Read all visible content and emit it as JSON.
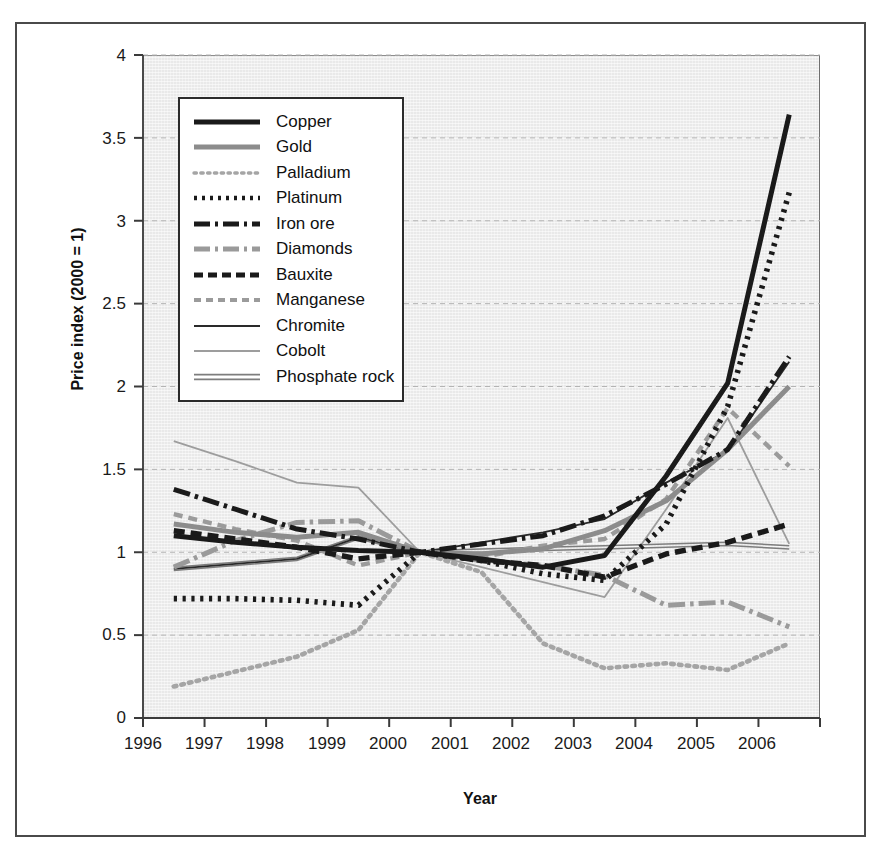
{
  "chart_data": {
    "type": "line",
    "title": "",
    "xlabel": "Year",
    "ylabel": "Price index (2000 = 1)",
    "xlim": [
      1996,
      2007
    ],
    "ylim": [
      0,
      4
    ],
    "x_tick_labels": [
      "1996",
      "1997",
      "1998",
      "1999",
      "2000",
      "2001",
      "2002",
      "2003",
      "2004",
      "2005",
      "2006"
    ],
    "y_tick_labels": [
      "0",
      "0.5",
      "1",
      "1.5",
      "2",
      "2.5",
      "3",
      "3.5",
      "4"
    ],
    "y_ticks": [
      0,
      0.5,
      1,
      1.5,
      2,
      2.5,
      3,
      3.5,
      4
    ],
    "grid": "horizontal-dashed",
    "legend_position": "upper-left-inside",
    "x": [
      1996.5,
      1997.5,
      1998.5,
      1999.5,
      2000.5,
      2001.5,
      2002.5,
      2003.5,
      2004.5,
      2005.5,
      2006.5
    ],
    "series": [
      {
        "name": "Copper",
        "style": "solid-thick-black",
        "color": "#1a1a1a",
        "values": [
          1.1,
          1.06,
          1.03,
          1.01,
          1.0,
          0.96,
          0.91,
          0.98,
          1.46,
          2.02,
          3.64
        ]
      },
      {
        "name": "Gold",
        "style": "solid-thick-gray",
        "color": "#8c8c8c",
        "values": [
          1.17,
          1.12,
          1.09,
          1.12,
          1.0,
          0.99,
          1.02,
          1.13,
          1.31,
          1.62,
          2.0
        ]
      },
      {
        "name": "Palladium",
        "style": "dotted-gray",
        "color": "#a5a5a5",
        "values": [
          0.19,
          0.28,
          0.37,
          0.53,
          1.0,
          0.88,
          0.45,
          0.3,
          0.33,
          0.29,
          0.45
        ]
      },
      {
        "name": "Platinum",
        "style": "dotted-black",
        "color": "#1a1a1a",
        "values": [
          0.72,
          0.72,
          0.71,
          0.68,
          1.0,
          0.95,
          0.87,
          0.83,
          1.17,
          1.88,
          3.17
        ]
      },
      {
        "name": "Iron ore",
        "style": "dashdot-thick-black",
        "color": "#1a1a1a",
        "values": [
          1.38,
          1.26,
          1.14,
          1.08,
          1.0,
          1.05,
          1.1,
          1.22,
          1.41,
          1.62,
          2.18
        ]
      },
      {
        "name": "Diamonds",
        "style": "dashdot-thick-gray",
        "color": "#9a9a9a",
        "values": [
          0.91,
          1.07,
          1.18,
          1.19,
          1.0,
          0.95,
          0.92,
          0.86,
          0.68,
          0.7,
          0.55
        ]
      },
      {
        "name": "Bauxite",
        "style": "dashed-thick-black",
        "color": "#1a1a1a",
        "values": [
          1.13,
          1.08,
          1.03,
          0.96,
          1.0,
          0.95,
          0.92,
          0.85,
          0.99,
          1.06,
          1.17
        ]
      },
      {
        "name": "Manganese",
        "style": "dashed-gray",
        "color": "#9b9b9b",
        "values": [
          1.23,
          1.14,
          1.07,
          0.92,
          1.0,
          0.97,
          1.04,
          1.08,
          1.32,
          1.87,
          1.52
        ]
      },
      {
        "name": "Chromite",
        "style": "solid-thin-black",
        "color": "#2a2a2a",
        "values": [
          0.9,
          0.93,
          0.96,
          1.09,
          1.0,
          1.06,
          1.12,
          1.2,
          1.42,
          1.61,
          2.15
        ]
      },
      {
        "name": "Cobolt",
        "style": "solid-thin-gray",
        "color": "#9d9d9d",
        "values": [
          1.67,
          1.55,
          1.42,
          1.39,
          1.0,
          0.91,
          0.82,
          0.73,
          1.26,
          1.81,
          1.05
        ]
      },
      {
        "name": "Phosphate rock",
        "style": "double-thin-gray",
        "color": "#7d7d7d",
        "values": [
          0.9,
          0.93,
          0.96,
          1.09,
          1.0,
          1.01,
          1.02,
          1.03,
          1.04,
          1.05,
          1.03
        ]
      }
    ]
  },
  "axes": {
    "y_label": "Price index (2000 = 1)",
    "x_label": "Year",
    "y_ticks": [
      "4",
      "3.5",
      "3",
      "2.5",
      "2",
      "1.5",
      "1",
      "0.5",
      "0"
    ],
    "x_ticks": [
      "1996",
      "1997",
      "1998",
      "1999",
      "2000",
      "2001",
      "2002",
      "2003",
      "2004",
      "2005",
      "2006"
    ]
  },
  "legend": {
    "items": [
      {
        "label": "Copper"
      },
      {
        "label": "Gold"
      },
      {
        "label": "Palladium"
      },
      {
        "label": "Platinum"
      },
      {
        "label": "Iron ore"
      },
      {
        "label": "Diamonds"
      },
      {
        "label": "Bauxite"
      },
      {
        "label": "Manganese"
      },
      {
        "label": "Chromite"
      },
      {
        "label": "Cobolt"
      },
      {
        "label": "Phosphate rock"
      }
    ]
  },
  "colors": {
    "plot_background": "#e9e9e9",
    "frame_border": "#4a4a4a",
    "gridline": "#b4b4b4",
    "black_series": "#1a1a1a",
    "gray_series": "#9a9a9a"
  }
}
